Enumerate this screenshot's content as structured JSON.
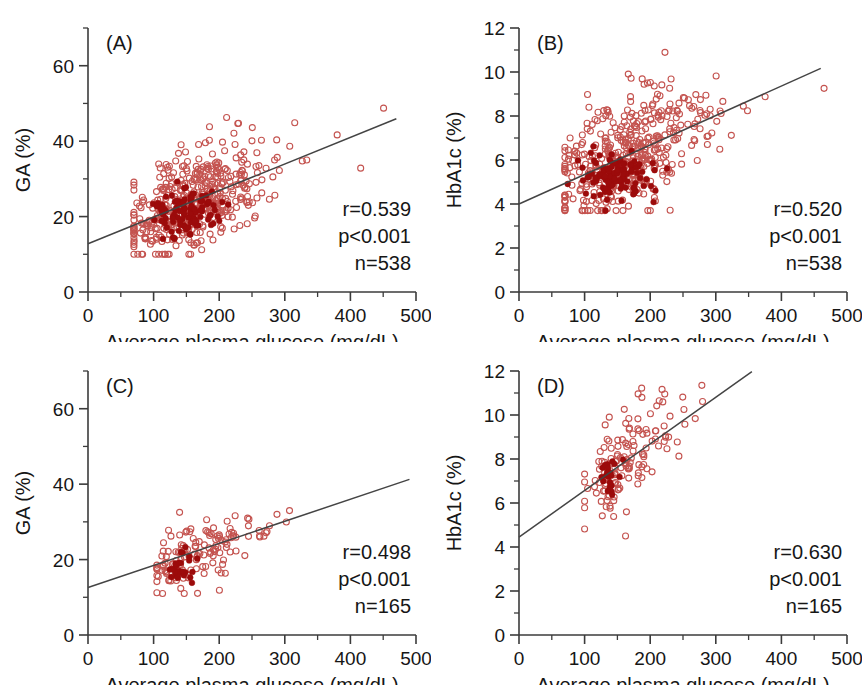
{
  "figure": {
    "width": 862,
    "height": 685,
    "background": "#ffffff",
    "marker_open_color": "#c4534f",
    "marker_filled_color": "#9c0b0b",
    "line_color": "#444444",
    "axis_color": "#3b3b3b"
  },
  "common": {
    "xlabel": "Average plasma glucose (mg/dL)",
    "x_ticks": [
      "0",
      "100",
      "200",
      "300",
      "400",
      "500"
    ],
    "x_tick_values": [
      0,
      100,
      200,
      300,
      400,
      500
    ],
    "x_minor_values": [
      50,
      150,
      250,
      350,
      450
    ],
    "xlim": [
      0,
      500
    ],
    "p_value": "p<0.001"
  },
  "chart_data": [
    {
      "id": "panel-a",
      "type": "scatter",
      "label": "(A)",
      "title": "",
      "xlabel": "Average plasma glucose (mg/dL)",
      "ylabel": "GA (%)",
      "xlim": [
        0,
        500
      ],
      "ylim": [
        0,
        70
      ],
      "y_ticks": [
        "0",
        "20",
        "40",
        "60"
      ],
      "y_tick_values": [
        0,
        20,
        40,
        60
      ],
      "y_minor_values": [
        10,
        30,
        50,
        70
      ],
      "grid": false,
      "legend": "none",
      "annotations": {
        "r": "r=0.539",
        "p": "p<0.001",
        "n": "n=538"
      },
      "stats": {
        "r": 0.539,
        "p": "<0.001",
        "n": 538
      },
      "regression": {
        "intercept": 12.8,
        "slope": 0.0705,
        "x_start": 0,
        "x_end": 470
      },
      "seed": 11,
      "n_open": 430,
      "n_filled": 108,
      "cluster": {
        "x_mean": 160,
        "x_sd": 52,
        "x_min": 70,
        "x_max": 470,
        "resid_sd": 6.2,
        "y_min": 10,
        "y_max": 63
      },
      "filled_cluster": {
        "x_mean": 148,
        "x_sd": 26,
        "y_mean": 21.5,
        "y_sd": 3.2
      }
    },
    {
      "id": "panel-b",
      "type": "scatter",
      "label": "(B)",
      "title": "",
      "xlabel": "Average plasma glucose (mg/dL)",
      "ylabel": "HbA1c (%)",
      "xlim": [
        0,
        500
      ],
      "ylim": [
        0,
        12
      ],
      "y_ticks": [
        "0",
        "2",
        "4",
        "6",
        "8",
        "10",
        "12"
      ],
      "y_tick_values": [
        0,
        2,
        4,
        6,
        8,
        10,
        12
      ],
      "y_minor_values": [
        1,
        3,
        5,
        7,
        9,
        11
      ],
      "grid": false,
      "legend": "none",
      "annotations": {
        "r": "r=0.520",
        "p": "p<0.001",
        "n": "n=538"
      },
      "stats": {
        "r": 0.52,
        "p": "<0.001",
        "n": 538
      },
      "regression": {
        "intercept": 4.0,
        "slope": 0.0134,
        "x_start": 0,
        "x_end": 460
      },
      "seed": 23,
      "n_open": 430,
      "n_filled": 108,
      "cluster": {
        "x_mean": 160,
        "x_sd": 52,
        "x_min": 70,
        "x_max": 465,
        "resid_sd": 1.25,
        "y_min": 3.7,
        "y_max": 11.6
      },
      "filled_cluster": {
        "x_mean": 148,
        "x_sd": 26,
        "y_mean": 5.2,
        "y_sd": 0.55
      }
    },
    {
      "id": "panel-c",
      "type": "scatter",
      "label": "(C)",
      "title": "",
      "xlabel": "Average plasma glucose (mg/dL)",
      "ylabel": "GA (%)",
      "xlim": [
        0,
        500
      ],
      "ylim": [
        0,
        70
      ],
      "y_ticks": [
        "0",
        "20",
        "40",
        "60"
      ],
      "y_tick_values": [
        0,
        20,
        40,
        60
      ],
      "y_minor_values": [
        10,
        30,
        50,
        70
      ],
      "grid": false,
      "legend": "none",
      "annotations": {
        "r": "r=0.498",
        "p": "p<0.001",
        "n": "n=165"
      },
      "stats": {
        "r": 0.498,
        "p": "<0.001",
        "n": 165
      },
      "regression": {
        "intercept": 12.6,
        "slope": 0.0585,
        "x_start": 0,
        "x_end": 490
      },
      "seed": 37,
      "n_open": 140,
      "n_filled": 25,
      "cluster": {
        "x_mean": 172,
        "x_sd": 42,
        "x_min": 105,
        "x_max": 370,
        "resid_sd": 4.6,
        "y_min": 11,
        "y_max": 39
      },
      "filled_cluster": {
        "x_mean": 142,
        "x_sd": 12,
        "y_mean": 17.5,
        "y_sd": 2.0
      }
    },
    {
      "id": "panel-d",
      "type": "scatter",
      "label": "(D)",
      "title": "",
      "xlabel": "Average plasma glucose (mg/dL)",
      "ylabel": "HbA1c (%)",
      "xlim": [
        0,
        500
      ],
      "ylim": [
        0,
        12
      ],
      "y_ticks": [
        "0",
        "2",
        "4",
        "6",
        "8",
        "10",
        "12"
      ],
      "y_tick_values": [
        0,
        2,
        4,
        6,
        8,
        10,
        12
      ],
      "y_minor_values": [
        1,
        3,
        5,
        7,
        9,
        11
      ],
      "grid": false,
      "legend": "none",
      "annotations": {
        "r": "r=0.630",
        "p": "p<0.001",
        "n": "n=165"
      },
      "stats": {
        "r": 0.63,
        "p": "<0.001",
        "n": 165
      },
      "regression": {
        "intercept": 4.45,
        "slope": 0.0212,
        "x_start": 0,
        "x_end": 355
      },
      "seed": 59,
      "n_open": 143,
      "n_filled": 22,
      "cluster": {
        "x_mean": 165,
        "x_sd": 40,
        "x_min": 100,
        "x_max": 360,
        "resid_sd": 1.0,
        "y_min": 4.0,
        "y_max": 11.7
      },
      "filled_cluster": {
        "x_mean": 137,
        "x_sd": 8,
        "y_mean": 7.1,
        "y_sd": 0.4
      }
    }
  ]
}
